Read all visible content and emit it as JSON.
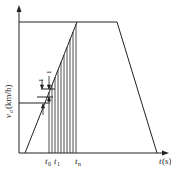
{
  "diagram": {
    "y_axis_label": "v",
    "y_axis_sub": "a",
    "y_axis_unit": "(km/h)",
    "x_axis_label": "t",
    "x_axis_unit": "(s)",
    "tick_labels": [
      {
        "main": "t",
        "sub": "0"
      },
      {
        "main": "t",
        "sub": "1"
      },
      {
        "main": "t",
        "sub": "n"
      }
    ],
    "step_marker": "1",
    "colors": {
      "line": "#222222",
      "background": "#ffffff"
    }
  }
}
